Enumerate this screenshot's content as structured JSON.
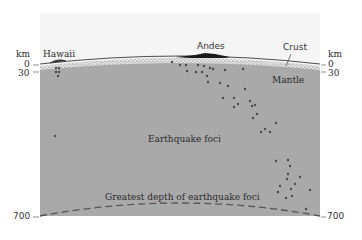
{
  "diagram": {
    "colors": {
      "background": "#ffffff",
      "sky_panel": "#f5f5f5",
      "mantle": "#a9a9a9",
      "crust": "#e6e6e6",
      "foci": "#4a4a4a",
      "dashed_line": "#555555",
      "text": "#2a2a2a"
    },
    "labels": {
      "hawaii": "Hawaii",
      "andes": "Andes",
      "crust": "Crust",
      "mantle": "Mantle",
      "earthquake_foci": "Earthquake foci",
      "greatest_depth": "Greatest depth of earthquake foci"
    },
    "left_axis": {
      "unit": "km",
      "ticks": [
        "0",
        "30",
        "700"
      ]
    },
    "right_axis": {
      "unit": "km",
      "ticks": [
        "0",
        "30",
        "700"
      ]
    }
  }
}
